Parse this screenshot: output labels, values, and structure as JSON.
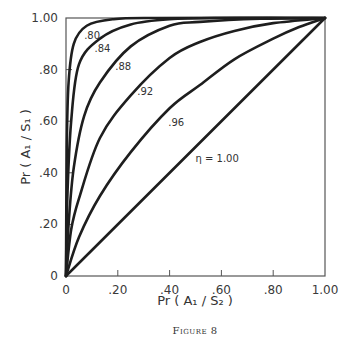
{
  "chart_data": {
    "type": "line",
    "title": "",
    "caption": "Figure 8",
    "xlabel": "Pr ( A₁ / S₂ )",
    "ylabel": "Pr ( A₁ / S₁ )",
    "xlim": [
      0,
      1
    ],
    "ylim": [
      0,
      1
    ],
    "grid": false,
    "legend": "inline curve labels",
    "x_ticks": [
      "0",
      ".20",
      ".40",
      ".60",
      ".80",
      "1.00"
    ],
    "y_ticks": [
      "0",
      ".20",
      ".40",
      ".60",
      ".80",
      "1.00"
    ],
    "series": [
      {
        "name": ".80",
        "label_pos": [
          0.07,
          0.92
        ],
        "points": [
          [
            0,
            0
          ],
          [
            0.003,
            0.5
          ],
          [
            0.01,
            0.75
          ],
          [
            0.03,
            0.9
          ],
          [
            0.08,
            0.97
          ],
          [
            0.18,
            0.995
          ],
          [
            0.35,
            1
          ],
          [
            1,
            1
          ]
        ]
      },
      {
        "name": ".84",
        "label_pos": [
          0.11,
          0.87
        ],
        "points": [
          [
            0,
            0
          ],
          [
            0.005,
            0.3
          ],
          [
            0.02,
            0.6
          ],
          [
            0.05,
            0.82
          ],
          [
            0.131,
            0.92
          ],
          [
            0.25,
            0.975
          ],
          [
            0.4,
            0.995
          ],
          [
            0.6,
            1
          ],
          [
            1,
            1
          ]
        ]
      },
      {
        "name": ".88",
        "label_pos": [
          0.19,
          0.8
        ],
        "points": [
          [
            0,
            0
          ],
          [
            0.01,
            0.2
          ],
          [
            0.03,
            0.42
          ],
          [
            0.07,
            0.62
          ],
          [
            0.131,
            0.75
          ],
          [
            0.25,
            0.89
          ],
          [
            0.4,
            0.97
          ],
          [
            0.517,
            0.985
          ],
          [
            0.75,
            0.997
          ],
          [
            1,
            1
          ]
        ]
      },
      {
        "name": ".92",
        "label_pos": [
          0.275,
          0.7
        ],
        "points": [
          [
            0,
            0
          ],
          [
            0.02,
            0.18
          ],
          [
            0.05,
            0.3
          ],
          [
            0.131,
            0.535
          ],
          [
            0.25,
            0.7
          ],
          [
            0.4,
            0.845
          ],
          [
            0.517,
            0.907
          ],
          [
            0.65,
            0.95
          ],
          [
            0.8,
            0.98
          ],
          [
            1,
            1
          ]
        ]
      },
      {
        "name": ".96",
        "label_pos": [
          0.395,
          0.58
        ],
        "points": [
          [
            0,
            0
          ],
          [
            0.05,
            0.15
          ],
          [
            0.131,
            0.31
          ],
          [
            0.25,
            0.48
          ],
          [
            0.4,
            0.65
          ],
          [
            0.517,
            0.74
          ],
          [
            0.65,
            0.84
          ],
          [
            0.8,
            0.92
          ],
          [
            0.9,
            0.965
          ],
          [
            1,
            1
          ]
        ]
      },
      {
        "name": "η = 1.00",
        "label_pos": [
          0.5,
          0.44
        ],
        "points": [
          [
            0,
            0
          ],
          [
            1,
            1
          ]
        ]
      }
    ]
  }
}
